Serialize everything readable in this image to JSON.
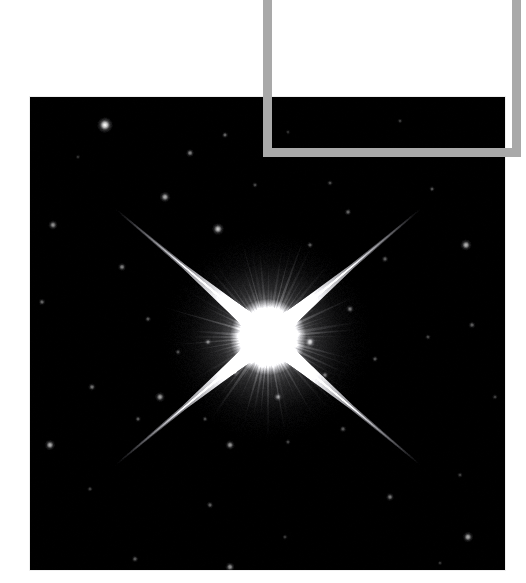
{
  "page": {
    "width": 526,
    "height": 583,
    "background_color": "#ffffff",
    "kind": "astronomical-photograph-with-crop-overlay"
  },
  "photo": {
    "name": "bright-star-field",
    "caption": "",
    "x": 30,
    "y": 97,
    "width": 475,
    "height": 473,
    "background_color": "#000000",
    "sky_color": "#050505"
  },
  "crop_overlay": {
    "color": "#a9a9a9",
    "thickness": 9,
    "bars": [
      {
        "name": "crop-bar-left",
        "x": 263,
        "y": 0,
        "width": 9,
        "height": 157
      },
      {
        "name": "crop-bar-right",
        "x": 512,
        "y": 0,
        "width": 9,
        "height": 157
      },
      {
        "name": "crop-bar-bottom",
        "x": 263,
        "y": 148,
        "width": 258,
        "height": 9
      }
    ]
  },
  "chart_data": {
    "type": "scatter",
    "title": "",
    "subtitle": "",
    "xlabel": "",
    "ylabel": "",
    "xlim": [
      0,
      475
    ],
    "ylim": [
      0,
      473
    ],
    "grid": false,
    "legend": "none",
    "background": "#000000",
    "primary_star": {
      "name": "central-bright-star",
      "cx": 238,
      "cy": 240,
      "core_radius": 17,
      "halo_radius": 105,
      "peak_color": "#ffffff",
      "spike_count": 4,
      "spike_angles_deg": [
        40,
        140,
        220,
        320
      ],
      "spike_length": 200,
      "spike_width": 5,
      "ray_count": 72
    },
    "field_stars": [
      {
        "x": 75,
        "y": 28,
        "r": 2.6,
        "b": 1.0
      },
      {
        "x": 195,
        "y": 38,
        "r": 1.1,
        "b": 0.45
      },
      {
        "x": 370,
        "y": 24,
        "r": 0.9,
        "b": 0.3
      },
      {
        "x": 160,
        "y": 56,
        "r": 1.4,
        "b": 0.55
      },
      {
        "x": 300,
        "y": 86,
        "r": 1.0,
        "b": 0.35
      },
      {
        "x": 23,
        "y": 128,
        "r": 1.6,
        "b": 0.6
      },
      {
        "x": 135,
        "y": 100,
        "r": 1.8,
        "b": 0.7
      },
      {
        "x": 225,
        "y": 88,
        "r": 1.0,
        "b": 0.35
      },
      {
        "x": 318,
        "y": 115,
        "r": 1.2,
        "b": 0.45
      },
      {
        "x": 402,
        "y": 92,
        "r": 1.0,
        "b": 0.38
      },
      {
        "x": 92,
        "y": 170,
        "r": 1.4,
        "b": 0.55
      },
      {
        "x": 188,
        "y": 132,
        "r": 2.0,
        "b": 0.8
      },
      {
        "x": 280,
        "y": 148,
        "r": 1.1,
        "b": 0.4
      },
      {
        "x": 355,
        "y": 162,
        "r": 1.2,
        "b": 0.42
      },
      {
        "x": 436,
        "y": 148,
        "r": 1.9,
        "b": 0.72
      },
      {
        "x": 12,
        "y": 205,
        "r": 1.2,
        "b": 0.45
      },
      {
        "x": 118,
        "y": 222,
        "r": 1.1,
        "b": 0.4
      },
      {
        "x": 148,
        "y": 255,
        "r": 1.0,
        "b": 0.35
      },
      {
        "x": 398,
        "y": 240,
        "r": 1.0,
        "b": 0.35
      },
      {
        "x": 442,
        "y": 228,
        "r": 1.2,
        "b": 0.42
      },
      {
        "x": 62,
        "y": 290,
        "r": 1.3,
        "b": 0.5
      },
      {
        "x": 130,
        "y": 300,
        "r": 1.7,
        "b": 0.65
      },
      {
        "x": 108,
        "y": 322,
        "r": 1.1,
        "b": 0.4
      },
      {
        "x": 175,
        "y": 322,
        "r": 1.0,
        "b": 0.35
      },
      {
        "x": 205,
        "y": 275,
        "r": 1.4,
        "b": 0.52
      },
      {
        "x": 178,
        "y": 245,
        "r": 1.2,
        "b": 0.45
      },
      {
        "x": 248,
        "y": 300,
        "r": 1.4,
        "b": 0.52
      },
      {
        "x": 295,
        "y": 278,
        "r": 1.2,
        "b": 0.44
      },
      {
        "x": 280,
        "y": 245,
        "r": 1.7,
        "b": 0.68
      },
      {
        "x": 320,
        "y": 212,
        "r": 1.3,
        "b": 0.48
      },
      {
        "x": 345,
        "y": 262,
        "r": 1.1,
        "b": 0.38
      },
      {
        "x": 20,
        "y": 348,
        "r": 1.8,
        "b": 0.7
      },
      {
        "x": 200,
        "y": 348,
        "r": 1.6,
        "b": 0.62
      },
      {
        "x": 258,
        "y": 345,
        "r": 1.0,
        "b": 0.32
      },
      {
        "x": 313,
        "y": 332,
        "r": 1.2,
        "b": 0.4
      },
      {
        "x": 360,
        "y": 400,
        "r": 1.4,
        "b": 0.5
      },
      {
        "x": 430,
        "y": 378,
        "r": 1.0,
        "b": 0.3
      },
      {
        "x": 180,
        "y": 408,
        "r": 1.2,
        "b": 0.42
      },
      {
        "x": 255,
        "y": 440,
        "r": 1.0,
        "b": 0.28
      },
      {
        "x": 105,
        "y": 462,
        "r": 1.2,
        "b": 0.4
      },
      {
        "x": 200,
        "y": 470,
        "r": 1.6,
        "b": 0.6
      },
      {
        "x": 438,
        "y": 440,
        "r": 1.8,
        "b": 0.7
      },
      {
        "x": 60,
        "y": 392,
        "r": 1.0,
        "b": 0.32
      },
      {
        "x": 465,
        "y": 300,
        "r": 1.0,
        "b": 0.3
      },
      {
        "x": 410,
        "y": 466,
        "r": 0.9,
        "b": 0.25
      },
      {
        "x": 48,
        "y": 60,
        "r": 0.9,
        "b": 0.25
      },
      {
        "x": 258,
        "y": 35,
        "r": 0.9,
        "b": 0.25
      },
      {
        "x": 455,
        "y": 58,
        "r": 0.9,
        "b": 0.22
      }
    ]
  }
}
